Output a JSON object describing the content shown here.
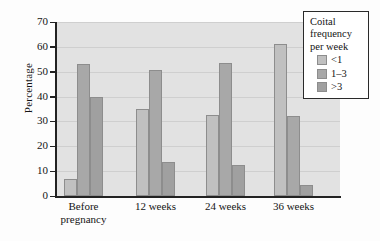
{
  "chart_data": {
    "type": "bar",
    "title": "",
    "xlabel": "",
    "ylabel": "Percentage",
    "ylim": [
      0,
      70
    ],
    "ytick_step": 10,
    "yticks": [
      70,
      60,
      50,
      40,
      30,
      20,
      10,
      0
    ],
    "grid": true,
    "grid_axis": "y",
    "categories": [
      "Before pregnancy",
      "12 weeks",
      "24 weeks",
      "36 weeks"
    ],
    "category_lines": [
      [
        "Before",
        "pregnancy"
      ],
      [
        "12 weeks"
      ],
      [
        "24 weeks"
      ],
      [
        "36 weeks"
      ]
    ],
    "legend_position": "top-right",
    "legend_title": "Coital frequency per week",
    "legend_title_lines": [
      "Coital",
      "frequency",
      "per week"
    ],
    "series": [
      {
        "name": "<1",
        "color": "#c0c0c0",
        "values": [
          7,
          35,
          32.5,
          61
        ]
      },
      {
        "name": "1–3",
        "color": "#a8a8a8",
        "values": [
          53,
          50.5,
          53.5,
          32
        ]
      },
      {
        "name": ">3",
        "color": "#a0a0a0",
        "values": [
          40,
          13.5,
          12.5,
          4.5
        ]
      }
    ]
  },
  "colors": {
    "plot_background": "#e2e2e2",
    "gridline": "#cfcfcf",
    "axis": "#222222",
    "bar_border": "#8d8d8d",
    "legend_border": "#2a2a2a",
    "legend_background": "#ffffff",
    "text": "#141414"
  }
}
